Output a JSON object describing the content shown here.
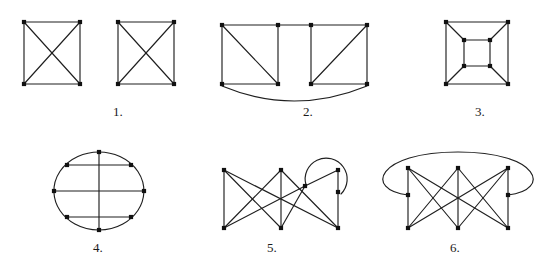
{
  "page": {
    "width": 551,
    "height": 263,
    "background": "#ffffff",
    "ink_color": "#1f1f1f",
    "node_color": "#111111"
  },
  "figures": [
    {
      "id": "figure-1",
      "label": "1.",
      "label_x": 118,
      "label_y": 104,
      "origin_x": 6,
      "origin_y": 8,
      "width": 190,
      "height": 88,
      "name": "two-k4-squares-with-diagonals",
      "components": [
        {
          "name": "left-k4",
          "nodes": [
            {
              "id": "a1",
              "x": 18,
              "y": 14
            },
            {
              "id": "a2",
              "x": 74,
              "y": 14
            },
            {
              "id": "a3",
              "x": 18,
              "y": 76
            },
            {
              "id": "a4",
              "x": 74,
              "y": 76
            }
          ],
          "edges": [
            [
              "a1",
              "a2"
            ],
            [
              "a1",
              "a3"
            ],
            [
              "a2",
              "a4"
            ],
            [
              "a3",
              "a4"
            ],
            [
              "a1",
              "a4"
            ],
            [
              "a2",
              "a3"
            ]
          ]
        },
        {
          "name": "right-k4",
          "nodes": [
            {
              "id": "b1",
              "x": 112,
              "y": 14
            },
            {
              "id": "b2",
              "x": 168,
              "y": 14
            },
            {
              "id": "b3",
              "x": 112,
              "y": 76
            },
            {
              "id": "b4",
              "x": 168,
              "y": 76
            }
          ],
          "edges": [
            [
              "b1",
              "b2"
            ],
            [
              "b1",
              "b3"
            ],
            [
              "b2",
              "b4"
            ],
            [
              "b3",
              "b4"
            ],
            [
              "b1",
              "b4"
            ],
            [
              "b2",
              "b3"
            ]
          ]
        }
      ],
      "arcs": []
    },
    {
      "id": "figure-2",
      "label": "2.",
      "label_x": 308,
      "label_y": 104,
      "origin_x": 206,
      "origin_y": 8,
      "width": 190,
      "height": 96,
      "name": "two-triangulated-squares-joined-by-top-edge-and-bottom-arc",
      "components": [
        {
          "name": "combined-graph",
          "nodes": [
            {
              "id": "c1",
              "x": 16,
              "y": 17
            },
            {
              "id": "c2",
              "x": 72,
              "y": 17
            },
            {
              "id": "c3",
              "x": 105,
              "y": 17
            },
            {
              "id": "c4",
              "x": 161,
              "y": 17
            },
            {
              "id": "c5",
              "x": 16,
              "y": 76
            },
            {
              "id": "c6",
              "x": 72,
              "y": 76
            },
            {
              "id": "c7",
              "x": 105,
              "y": 76
            },
            {
              "id": "c8",
              "x": 161,
              "y": 76
            }
          ],
          "edges": [
            [
              "c1",
              "c2"
            ],
            [
              "c2",
              "c3"
            ],
            [
              "c3",
              "c4"
            ],
            [
              "c1",
              "c5"
            ],
            [
              "c2",
              "c6"
            ],
            [
              "c3",
              "c7"
            ],
            [
              "c4",
              "c8"
            ],
            [
              "c5",
              "c6"
            ],
            [
              "c7",
              "c8"
            ],
            [
              "c1",
              "c6"
            ],
            [
              "c4",
              "c7"
            ]
          ]
        }
      ],
      "arcs": [
        {
          "name": "bottom-arc-c5-c8",
          "d": "M 16 78 Q 88 108 161 78"
        }
      ]
    },
    {
      "id": "figure-3",
      "label": "3.",
      "label_x": 480,
      "label_y": 104,
      "origin_x": 430,
      "origin_y": 8,
      "width": 110,
      "height": 88,
      "name": "cube-graph-nested-squares",
      "components": [
        {
          "name": "cube-q3",
          "nodes": [
            {
              "id": "o1",
              "x": 16,
              "y": 14
            },
            {
              "id": "o2",
              "x": 78,
              "y": 14
            },
            {
              "id": "o3",
              "x": 16,
              "y": 76
            },
            {
              "id": "o4",
              "x": 78,
              "y": 76
            },
            {
              "id": "i1",
              "x": 34,
              "y": 32
            },
            {
              "id": "i2",
              "x": 60,
              "y": 32
            },
            {
              "id": "i3",
              "x": 34,
              "y": 58
            },
            {
              "id": "i4",
              "x": 60,
              "y": 58
            }
          ],
          "edges": [
            [
              "o1",
              "o2"
            ],
            [
              "o1",
              "o3"
            ],
            [
              "o2",
              "o4"
            ],
            [
              "o3",
              "o4"
            ],
            [
              "i1",
              "i2"
            ],
            [
              "i1",
              "i3"
            ],
            [
              "i2",
              "i4"
            ],
            [
              "i3",
              "i4"
            ],
            [
              "o1",
              "i1"
            ],
            [
              "o2",
              "i2"
            ],
            [
              "o3",
              "i3"
            ],
            [
              "o4",
              "i4"
            ]
          ]
        }
      ],
      "arcs": []
    },
    {
      "id": "figure-4",
      "label": "4.",
      "label_x": 98,
      "label_y": 240,
      "origin_x": 48,
      "origin_y": 146,
      "width": 104,
      "height": 92,
      "name": "circle-eight-cycle-with-chords",
      "components": [
        {
          "name": "octagon-on-circle",
          "nodes": [
            {
              "id": "p1",
              "x": 51,
              "y": 6
            },
            {
              "id": "p2",
              "x": 83,
              "y": 19
            },
            {
              "id": "p3",
              "x": 96,
              "y": 45
            },
            {
              "id": "p4",
              "x": 83,
              "y": 71
            },
            {
              "id": "p5",
              "x": 51,
              "y": 84
            },
            {
              "id": "p6",
              "x": 19,
              "y": 71
            },
            {
              "id": "p7",
              "x": 6,
              "y": 45
            },
            {
              "id": "p8",
              "x": 19,
              "y": 19
            }
          ],
          "edges": [
            [
              "p8",
              "p2"
            ],
            [
              "p7",
              "p3"
            ],
            [
              "p6",
              "p4"
            ],
            [
              "p1",
              "p5"
            ]
          ]
        }
      ],
      "arcs": [
        {
          "name": "circle-outline",
          "d": "M 51 6 A 45 39 0 1 1 50.8 6"
        }
      ]
    },
    {
      "id": "figure-5",
      "label": "5.",
      "label_x": 272,
      "label_y": 240,
      "origin_x": 210,
      "origin_y": 156,
      "width": 140,
      "height": 80,
      "name": "bipartite-graph-with-right-loop",
      "components": [
        {
          "name": "k33-with-extra-right-nodes",
          "nodes": [
            {
              "id": "t1",
              "x": 14,
              "y": 14
            },
            {
              "id": "t2",
              "x": 71,
              "y": 14
            },
            {
              "id": "t3",
              "x": 128,
              "y": 14
            },
            {
              "id": "m1",
              "x": 95,
              "y": 30
            },
            {
              "id": "m2",
              "x": 128,
              "y": 36
            },
            {
              "id": "b1",
              "x": 14,
              "y": 72
            },
            {
              "id": "b2",
              "x": 71,
              "y": 72
            },
            {
              "id": "b3",
              "x": 128,
              "y": 72
            }
          ],
          "edges": [
            [
              "t1",
              "b1"
            ],
            [
              "t1",
              "b2"
            ],
            [
              "t1",
              "b3"
            ],
            [
              "t2",
              "b1"
            ],
            [
              "t2",
              "b2"
            ],
            [
              "t2",
              "b3"
            ],
            [
              "m1",
              "b1"
            ],
            [
              "m1",
              "b2"
            ],
            [
              "t3",
              "m2"
            ],
            [
              "m2",
              "b3"
            ],
            [
              "m1",
              "t3"
            ]
          ]
        }
      ],
      "arcs": [
        {
          "name": "loop-arc-top-right",
          "d": "M 96 29 A 21 21 0 1 1 131 38"
        }
      ]
    },
    {
      "id": "figure-6",
      "label": "6.",
      "label_x": 455,
      "label_y": 240,
      "origin_x": 382,
      "origin_y": 150,
      "width": 160,
      "height": 86,
      "name": "bipartite-graph-with-large-outer-arc",
      "components": [
        {
          "name": "k33-with-middle-nodes",
          "nodes": [
            {
              "id": "u1",
              "x": 26,
              "y": 18
            },
            {
              "id": "u2",
              "x": 76,
              "y": 18
            },
            {
              "id": "u3",
              "x": 126,
              "y": 18
            },
            {
              "id": "v1",
              "x": 26,
              "y": 45
            },
            {
              "id": "v2",
              "x": 126,
              "y": 45
            },
            {
              "id": "w1",
              "x": 26,
              "y": 78
            },
            {
              "id": "w2",
              "x": 76,
              "y": 78
            },
            {
              "id": "w3",
              "x": 126,
              "y": 78
            }
          ],
          "edges": [
            [
              "u1",
              "v1"
            ],
            [
              "v1",
              "w1"
            ],
            [
              "u3",
              "v2"
            ],
            [
              "v2",
              "w3"
            ],
            [
              "u1",
              "w2"
            ],
            [
              "u1",
              "w3"
            ],
            [
              "u2",
              "w1"
            ],
            [
              "u2",
              "w3"
            ],
            [
              "u3",
              "w1"
            ],
            [
              "u3",
              "w2"
            ],
            [
              "u2",
              "w2"
            ]
          ]
        }
      ],
      "arcs": [
        {
          "name": "outer-ellipse-arc-v1-v2",
          "d": "M 26 45 C -18 40 -6 2 76 2 C 158 2 170 40 126 45"
        }
      ]
    }
  ]
}
